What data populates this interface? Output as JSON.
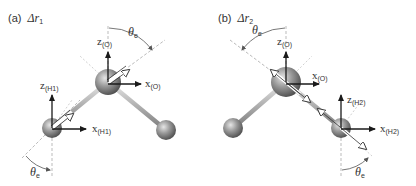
{
  "panels": [
    {
      "id": "a",
      "label": "(a)",
      "title_symbol": "Δr",
      "title_sub": "1",
      "angle_label": "θ",
      "angle_sub": "e",
      "axes": {
        "oxygen": {
          "z": "z",
          "x": "x",
          "sub": "(O)"
        },
        "hydrogen": {
          "z": "z",
          "x": "x",
          "sub": "(H1)"
        }
      }
    },
    {
      "id": "b",
      "label": "(b)",
      "title_symbol": "Δr",
      "title_sub": "2",
      "angle_label": "θ",
      "angle_sub": "e",
      "axes": {
        "oxygen": {
          "z": "z",
          "x": "x",
          "sub": "(O)"
        },
        "hydrogen": {
          "z": "z",
          "x": "x",
          "sub": "(H2)"
        }
      }
    }
  ],
  "colors": {
    "atom_dark": "#4a4a4a",
    "atom_light": "#bdbdbd",
    "bond": "#b5b5b5",
    "axis": "#1a1a1a",
    "dashed": "#aaaaaa",
    "text": "#333333"
  }
}
